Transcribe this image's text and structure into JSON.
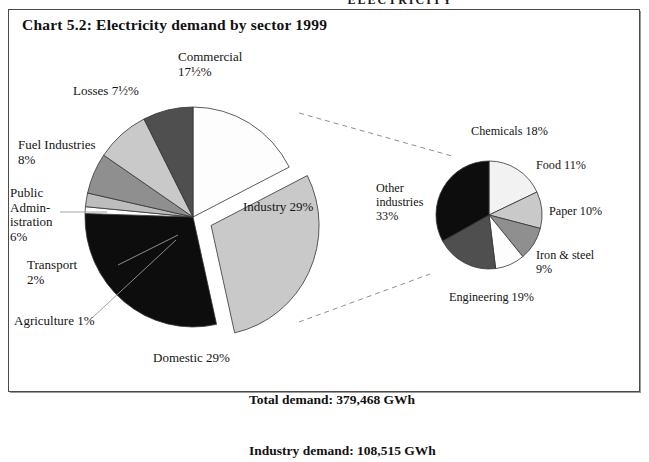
{
  "page_header": "ELECTRICITY",
  "title": "Chart 5.2:  Electricity demand by sector 1999",
  "totals": {
    "total_label": "Total demand: 379,468 GWh",
    "industry_label": "Industry demand: 108,515 GWh"
  },
  "labels": {
    "commercial": "Commercial\n17½%",
    "losses": "Losses 7½%",
    "fuel_industries": "Fuel Industries\n8%",
    "public_administration": "Public\nAdmin-\nistration\n6%",
    "transport": "Transport\n2%",
    "agriculture": "Agriculture 1%",
    "domestic": "Domestic 29%",
    "industry": "Industry 29%",
    "chemicals": "Chemicals 18%",
    "food": "Food 11%",
    "paper": "Paper 10%",
    "iron_steel": "Iron & steel\n9%",
    "engineering": "Engineering 19%",
    "other_industries": "Other\nindustries\n33%"
  },
  "colors": {
    "white": "#fdfdfd",
    "near_white": "#f2f2f2",
    "light_gray": "#c9c9c9",
    "light_gray2": "#bdbdbd",
    "mid_gray": "#8f8f8f",
    "mid_gray2": "#a5a5a5",
    "dark_gray": "#4f4f4f",
    "black": "#0d0d0d",
    "outline": "#333333",
    "frame": "#4a4a4a",
    "leader": "#8a8a8a"
  },
  "chart_data": [
    {
      "type": "pie",
      "name": "main-pie",
      "title": "Electricity demand by sector 1999",
      "unit": "%",
      "total_demand_gwh": 379468,
      "exploded_slice": "Industry",
      "start_angle_deg": 0,
      "direction": "clockwise",
      "categories": [
        "Commercial",
        "Industry",
        "Domestic",
        "Agriculture",
        "Transport",
        "Public Administration",
        "Fuel Industries",
        "Losses"
      ],
      "values": [
        17.5,
        29,
        29,
        1,
        2,
        6,
        8,
        7.5
      ],
      "display_values": [
        "17½%",
        "29%",
        "29%",
        "1%",
        "2%",
        "6%",
        "8%",
        "7½%"
      ],
      "fills": [
        "#fdfdfd",
        "#c9c9c9",
        "#0d0d0d",
        "#fdfdfd",
        "#bdbdbd",
        "#8f8f8f",
        "#c9c9c9",
        "#4f4f4f"
      ],
      "legend": "none"
    },
    {
      "type": "pie",
      "name": "industry-breakdown-pie",
      "title": "Industry demand by sub-sector",
      "unit": "%",
      "industry_demand_gwh": 108515,
      "start_angle_deg": 0,
      "direction": "clockwise",
      "categories": [
        "Chemicals",
        "Food",
        "Paper",
        "Iron & steel",
        "Engineering",
        "Other industries"
      ],
      "values": [
        18,
        11,
        10,
        9,
        19,
        33
      ],
      "display_values": [
        "18%",
        "11%",
        "10%",
        "9%",
        "19%",
        "33%"
      ],
      "fills": [
        "#f2f2f2",
        "#c9c9c9",
        "#8f8f8f",
        "#fdfdfd",
        "#4f4f4f",
        "#0d0d0d"
      ],
      "legend": "none"
    }
  ]
}
